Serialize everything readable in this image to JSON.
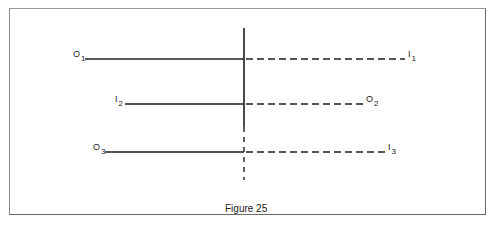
{
  "figure": {
    "caption": "Figure 25",
    "line_color": "#1e1e1e",
    "vertical_axis": {
      "x": 244,
      "solid_from_y": 28,
      "solid_to_y": 127,
      "dashed_to_y": 180
    },
    "rays": [
      {
        "id": "ray-1",
        "left_label": {
          "letter": "O",
          "sub": "1"
        },
        "right_label": {
          "letter": "I",
          "sub": "1"
        },
        "y": 59,
        "solid_from_x": 85,
        "dashed_to_x": 405
      },
      {
        "id": "ray-2",
        "left_label": {
          "letter": "I",
          "sub": "2"
        },
        "right_label": {
          "letter": "O",
          "sub": "2"
        },
        "y": 104,
        "solid_from_x": 125,
        "dashed_to_x": 364
      },
      {
        "id": "ray-3",
        "left_label": {
          "letter": "O",
          "sub": "3"
        },
        "right_label": {
          "letter": "I",
          "sub": "3"
        },
        "y": 152,
        "solid_from_x": 105,
        "dashed_to_x": 386
      }
    ]
  }
}
